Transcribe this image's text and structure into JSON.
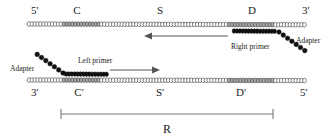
{
  "figure": {
    "caption_label": "R"
  },
  "colors": {
    "bead_white": "#ffffff",
    "bead_gray": "#a8a8a8",
    "bead_black": "#101010",
    "outline": "#3a3a3a",
    "arrow": "#555555",
    "bracket": "#777777",
    "text": "#1a1a1a",
    "background": "#ffffff"
  },
  "top_strand": {
    "name": "top-strand",
    "end_left_label": "5'",
    "end_right_label": "3'",
    "region_labels": [
      "C",
      "S",
      "D"
    ],
    "primer_label": "Right primer",
    "adapter_label": "Adapter",
    "arrow_direction": "left",
    "bead_count": 96,
    "gray_ranges": [
      [
        12,
        24
      ],
      [
        69,
        84
      ]
    ],
    "primer_bead_count": 15,
    "adapter_bead_count": 7
  },
  "bottom_strand": {
    "name": "bottom-strand",
    "end_left_label": "3'",
    "end_right_label": "5'",
    "region_labels": [
      "C'",
      "S'",
      "D'"
    ],
    "primer_label": "Left primer",
    "adapter_label": "Adapter",
    "arrow_direction": "right",
    "bead_count": 96,
    "gray_ranges": [
      [
        12,
        24
      ],
      [
        69,
        84
      ]
    ],
    "primer_bead_count": 15,
    "adapter_bead_count": 7
  },
  "span_bracket": {
    "name": "amplicon-span",
    "label": "R",
    "x_start": 61,
    "x_end": 273
  },
  "labels": {
    "top_5prime": "5'",
    "top_C": "C",
    "top_S": "S",
    "top_D": "D",
    "top_3prime": "3'",
    "right_primer": "Right primer",
    "top_adapter": "Adapter",
    "bottom_adapter": "Adapter",
    "left_primer": "Left primer",
    "bottom_3prime": "3'",
    "bottom_Cp": "C'",
    "bottom_Sp": "S'",
    "bottom_Dp": "D'",
    "bottom_5prime": "5'",
    "span_R": "R"
  }
}
